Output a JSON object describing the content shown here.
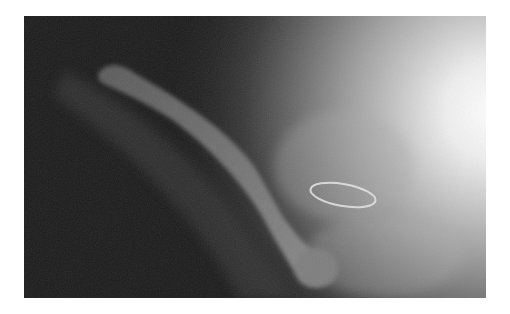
{
  "image": {
    "kind": "radiograph",
    "subject": "hip joint with femoral stem prosthesis and circular wire ring",
    "colors": {
      "dark_background": "#1c1c1c",
      "bright_region": "#f8f8f8",
      "prosthesis": "#7a7a7a",
      "ring": "#e6e6e6"
    }
  }
}
